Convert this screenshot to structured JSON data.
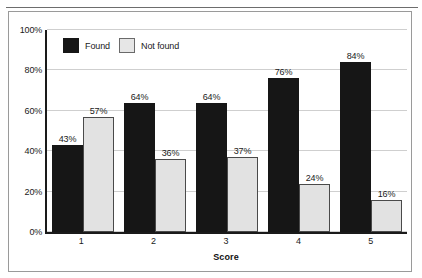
{
  "chart_data": {
    "type": "bar",
    "title": "",
    "xlabel": "Score",
    "ylabel": "",
    "categories": [
      "1",
      "2",
      "3",
      "4",
      "5"
    ],
    "series": [
      {
        "name": "Found",
        "values": [
          43,
          64,
          64,
          76,
          84
        ],
        "color": "#161616"
      },
      {
        "name": "Not found",
        "values": [
          57,
          36,
          37,
          24,
          16
        ],
        "color": "#e2e2e2"
      }
    ],
    "data_labels": {
      "Found": [
        "43%",
        "64%",
        "64%",
        "76%",
        "84%"
      ],
      "Not found": [
        "57%",
        "36%",
        "37%",
        "24%",
        "16%"
      ]
    },
    "ylim": [
      0,
      100
    ],
    "yticks": [
      0,
      20,
      40,
      60,
      80,
      100
    ],
    "ytick_labels": [
      "0%",
      "20%",
      "40%",
      "60%",
      "80%",
      "100%"
    ],
    "grid": true,
    "legend_position": "top-left-inside",
    "legend": [
      {
        "label": "Found",
        "swatch": "dark-filled-square"
      },
      {
        "label": "Not found",
        "swatch": "light-filled-square"
      }
    ]
  },
  "axis": {
    "x_title": "Score"
  }
}
